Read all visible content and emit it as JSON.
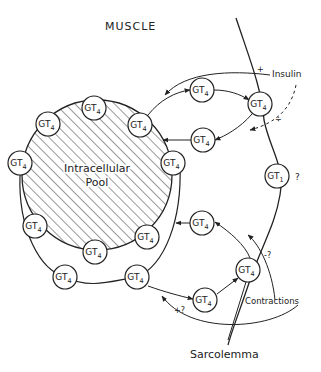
{
  "title": "MUSCLE",
  "pool_label_line1": "Intracellular",
  "pool_label_line2": "Pool",
  "labels": {
    "insulin": "Insulin",
    "contractions": "Contractions",
    "sarcolemma": "Sarcolemma",
    "plus": "+",
    "minus_plus": "÷",
    "question": "?",
    "minus_q": "-?",
    "plus_q": "+?"
  },
  "transporters": [
    {
      "id": "pool-top",
      "base": "GT",
      "sub": "4",
      "x": 94,
      "y": 108
    },
    {
      "id": "pool-upper-left",
      "base": "GT",
      "sub": "4",
      "x": 48,
      "y": 124
    },
    {
      "id": "pool-left",
      "base": "GT",
      "sub": "4",
      "x": 20,
      "y": 163
    },
    {
      "id": "pool-upper-right",
      "base": "GT",
      "sub": "4",
      "x": 140,
      "y": 125
    },
    {
      "id": "pool-right",
      "base": "GT",
      "sub": "4",
      "x": 173,
      "y": 163
    },
    {
      "id": "pool-lower-left",
      "base": "GT",
      "sub": "4",
      "x": 35,
      "y": 226
    },
    {
      "id": "pool-bottom",
      "base": "GT",
      "sub": "4",
      "x": 95,
      "y": 252
    },
    {
      "id": "pool-lower-right",
      "base": "GT",
      "sub": "4",
      "x": 147,
      "y": 237
    },
    {
      "id": "loop-left",
      "base": "GT",
      "sub": "4",
      "x": 65,
      "y": 277
    },
    {
      "id": "loop-right",
      "base": "GT",
      "sub": "4",
      "x": 137,
      "y": 277
    },
    {
      "id": "transit-top",
      "base": "GT",
      "sub": "4",
      "x": 202,
      "y": 90
    },
    {
      "id": "membrane-top",
      "base": "GT",
      "sub": "4",
      "x": 260,
      "y": 104
    },
    {
      "id": "return-top",
      "base": "GT",
      "sub": "4",
      "x": 203,
      "y": 140
    },
    {
      "id": "membrane-gt1",
      "base": "GT",
      "sub": "1",
      "x": 277,
      "y": 176
    },
    {
      "id": "return-bottom",
      "base": "GT",
      "sub": "4",
      "x": 202,
      "y": 223
    },
    {
      "id": "membrane-bottom",
      "base": "GT",
      "sub": "4",
      "x": 248,
      "y": 270
    },
    {
      "id": "transit-bottom",
      "base": "GT",
      "sub": "4",
      "x": 205,
      "y": 300
    }
  ]
}
